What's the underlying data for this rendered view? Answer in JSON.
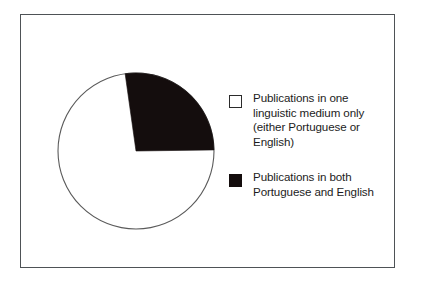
{
  "figure": {
    "kind": "pie-chart-figure",
    "background_color": "#ffffff",
    "frame_color": "#4e5256"
  },
  "chart_data": {
    "type": "pie",
    "title": "",
    "subtitle": "",
    "xlabel": "",
    "ylabel": "",
    "grid": false,
    "legend_position": "right",
    "start_angle_deg": -8,
    "labels": [
      "Publications  in one linguistic medium only (either Portuguese or English)",
      "Publications in both Portuguese and English"
    ],
    "values": [
      73,
      27
    ],
    "value_unit": "percent",
    "colors": [
      "#ffffff",
      "#140d0d"
    ],
    "slice_outline_color": "#5a5a5a",
    "data_labels_shown": false,
    "slices": [
      {
        "label": "Publications  in one linguistic medium only (either Portuguese or English)",
        "value": 73,
        "color": "#ffffff",
        "start_deg": 90,
        "end_deg": 352
      },
      {
        "label": "Publications in both Portuguese and English",
        "value": 27,
        "color": "#140d0d",
        "start_deg": 352,
        "end_deg": 90
      }
    ]
  },
  "legend": {
    "items": [
      {
        "swatch_style": "hollow",
        "swatch_color": "#ffffff",
        "label": "Publications  in one\nlinguistic medium only\n(either Portuguese or\nEnglish)"
      },
      {
        "swatch_style": "solid",
        "swatch_color": "#140d0d",
        "label": "Publications in both\nPortuguese and English"
      }
    ]
  }
}
